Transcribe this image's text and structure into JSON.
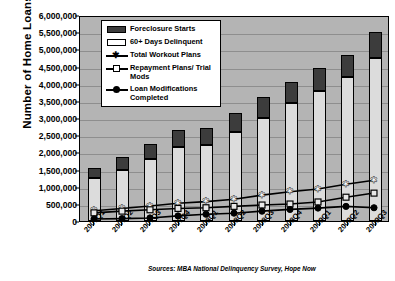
{
  "chart_data": {
    "type": "bar",
    "title": "",
    "xlabel": "",
    "ylabel": "Number of Home Loans",
    "ylim": [
      0,
      6000000
    ],
    "ytick_step": 500000,
    "grid": true,
    "legend_position": "top-left-inside",
    "stacked": true,
    "categories": [
      "2007Q1",
      "2007Q2",
      "2007Q3",
      "2007Q4",
      "2008Q1",
      "2008Q2",
      "2008Q3",
      "2008Q4",
      "2009Q1",
      "2009Q2",
      "2009Q3"
    ],
    "ytick_labels": [
      "0",
      "500,000",
      "1,000,000",
      "1,500,000",
      "2,000,000",
      "2,500,000",
      "3,000,000",
      "3,500,000",
      "4,000,000",
      "4,500,000",
      "5,000,000",
      "5,500,000",
      "6,000,000"
    ],
    "ytick_values": [
      0,
      500000,
      1000000,
      1500000,
      2000000,
      2500000,
      3000000,
      3500000,
      4000000,
      4500000,
      5000000,
      5500000,
      6000000
    ],
    "series": [
      {
        "name": "60+ Days Delinquent",
        "kind": "bar-segment",
        "color": "#dcdcdc",
        "values": [
          1250000,
          1500000,
          1800000,
          2150000,
          2200000,
          2600000,
          3000000,
          3450000,
          3800000,
          4200000,
          4750000
        ]
      },
      {
        "name": "Foreclosure Starts",
        "kind": "bar-segment",
        "color": "#3c3c3c",
        "values": [
          300000,
          350000,
          450000,
          500000,
          500000,
          550000,
          600000,
          600000,
          650000,
          650000,
          750000
        ]
      },
      {
        "name": "Total Workout Plans",
        "kind": "line",
        "marker": "star",
        "color": "#000000",
        "values": [
          300000,
          370000,
          440000,
          520000,
          570000,
          640000,
          760000,
          860000,
          940000,
          1080000,
          1200000
        ]
      },
      {
        "name": "Repayment Plans/ Trial Mods",
        "kind": "line",
        "marker": "open-square",
        "color": "#000000",
        "values": [
          240000,
          290000,
          330000,
          370000,
          390000,
          430000,
          470000,
          500000,
          560000,
          700000,
          820000
        ]
      },
      {
        "name": "Loan Modifications Completed",
        "kind": "line",
        "marker": "filled-circle",
        "color": "#000000",
        "values": [
          60000,
          70000,
          90000,
          150000,
          200000,
          230000,
          290000,
          340000,
          380000,
          430000,
          390000
        ]
      }
    ],
    "bar_totals": [
      1550000,
      1850000,
      2250000,
      2650000,
      2700000,
      3150000,
      3600000,
      4050000,
      4450000,
      4850000,
      5500000
    ],
    "source_note": "Sources: MBA National Delinquency Survey, Hope Now"
  },
  "legend": {
    "items": [
      {
        "label": "Foreclosure Starts",
        "key": "swatch-dark"
      },
      {
        "label": "60+ Days Delinquent",
        "key": "swatch-light"
      },
      {
        "label": "Total Workout Plans",
        "key": "line-star"
      },
      {
        "label": "Repayment Plans/ Trial Mods",
        "key": "line-open-square"
      },
      {
        "label": "Loan Modifications Completed",
        "key": "line-filled-circle"
      }
    ]
  },
  "colors": {
    "plot_background": "#b4b4b4",
    "gridline": "#8e8e8e",
    "foreclosure": "#3c3c3c",
    "delinquent": "#dcdcdc",
    "line": "#000000",
    "axis": "#000000"
  }
}
